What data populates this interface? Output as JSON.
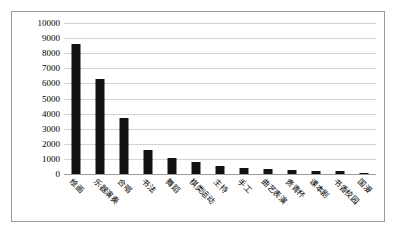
{
  "chart_data": {
    "type": "bar",
    "title": "",
    "subtitle": "",
    "xlabel": "",
    "ylabel": "",
    "ylim": [
      0,
      10000
    ],
    "ytick_step": 1000,
    "yticks": [
      "10000",
      "9000",
      "8000",
      "7000",
      "6000",
      "5000",
      "4000",
      "3000",
      "2000",
      "1000",
      "0"
    ],
    "grid": true,
    "legend": false,
    "legend_position": "none",
    "bar_color": "#111111",
    "gridline_color": "#d2d2d2",
    "axis_color": "#9a9a9a",
    "border_color": "#9a9a9a",
    "plot_background": "#ffffff",
    "categories": [
      "绘画",
      "乐器演奏",
      "合唱",
      "书法",
      "舞蹈",
      "棋类运动",
      "主持",
      "手工",
      "曲艺表演",
      "贵青杯",
      "课本剧",
      "书香校园",
      "国漫"
    ],
    "values": [
      8600,
      6300,
      3700,
      1600,
      1050,
      800,
      550,
      420,
      300,
      250,
      220,
      200,
      80
    ]
  }
}
